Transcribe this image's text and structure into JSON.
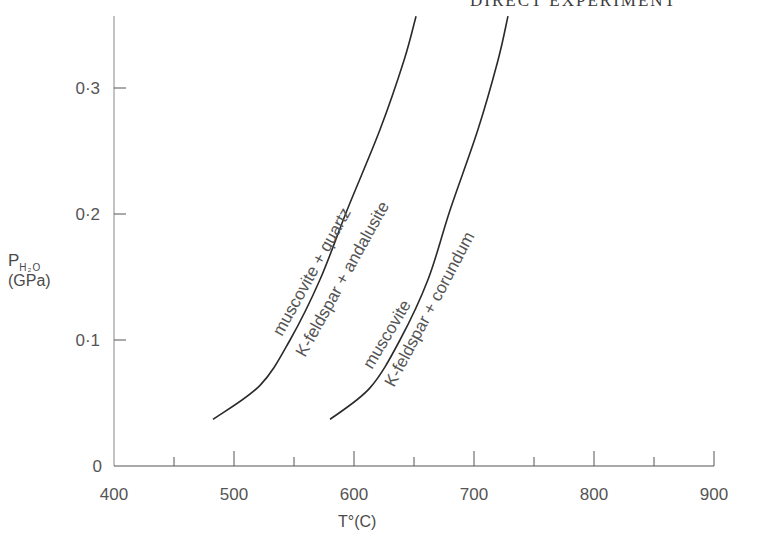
{
  "page_header": "DIRECT EXPERIMENT",
  "chart_data": {
    "type": "line",
    "title": "",
    "xlabel": "T°(C)",
    "ylabel": "P H2O (GPa)",
    "ylabel_parts": {
      "symbol": "P",
      "subscript": "H₂O",
      "unit": "(GPa)"
    },
    "xlim": [
      400,
      900
    ],
    "ylim": [
      0,
      0.36
    ],
    "x_ticks": [
      400,
      500,
      600,
      700,
      800,
      900
    ],
    "x_tick_labels": [
      "400",
      "500",
      "600",
      "700",
      "800",
      "900"
    ],
    "x_minor_ticks": [
      450,
      550,
      650,
      750,
      850
    ],
    "y_ticks": [
      0,
      0.1,
      0.2,
      0.3
    ],
    "y_tick_labels": [
      "0",
      "0·1",
      "0·2",
      "0·3"
    ],
    "grid": false,
    "legend": "none (curves labeled inline)",
    "series": [
      {
        "name": "muscovite + quartz = K-feldspar + andalusite",
        "label_upper": "muscovite + quartz",
        "label_lower": "K-feldspar + andalusite",
        "x": [
          482.5,
          521.7,
          546.7,
          571.7,
          594.2,
          621.7,
          641.7,
          651.7
        ],
        "y": [
          0.037,
          0.064,
          0.1,
          0.148,
          0.203,
          0.267,
          0.322,
          0.357
        ]
      },
      {
        "name": "muscovite = K-feldspar + corundum",
        "label_upper": "muscovite",
        "label_lower": "K-feldspar + corundum",
        "x": [
          580.0,
          613.3,
          638.3,
          661.7,
          680.0,
          703.3,
          720.0,
          728.3
        ],
        "y": [
          0.037,
          0.062,
          0.1,
          0.148,
          0.203,
          0.267,
          0.322,
          0.357
        ]
      }
    ],
    "colors": {
      "axis": "#555555",
      "curve": "#2a2a2a",
      "text": "#4a4a4a"
    }
  },
  "labels": {
    "curve1_upper": "muscovite + quartz",
    "curve1_lower": "K-feldspar + andalusite",
    "curve2_upper": "muscovite",
    "curve2_lower": "K-feldspar + corundum"
  }
}
